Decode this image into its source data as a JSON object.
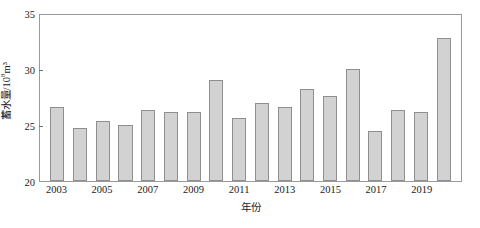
{
  "chart_data": {
    "type": "bar",
    "title": "",
    "subtitle": "",
    "xlabel": "年份",
    "ylabel": "蓄水量/10⁸m³",
    "ylabel_main": "蓄水量/10",
    "ylabel_exp": "8",
    "ylabel_unit": "m³",
    "ylim": [
      20,
      35
    ],
    "yticks": [
      20,
      25,
      30,
      35
    ],
    "ytick_labels": [
      "20",
      "25",
      "30",
      "35"
    ],
    "grid": false,
    "legend": null,
    "categories": [
      "2003",
      "2004",
      "2005",
      "2006",
      "2007",
      "2008",
      "2009",
      "2010",
      "2011",
      "2012",
      "2013",
      "2014",
      "2015",
      "2016",
      "2017",
      "2018",
      "2019",
      "2020"
    ],
    "xtick_labels": [
      "2003",
      "2005",
      "2007",
      "2009",
      "2011",
      "2013",
      "2015",
      "2017",
      "2019"
    ],
    "values": [
      26.6,
      24.7,
      25.4,
      25.0,
      26.3,
      26.2,
      26.2,
      29.0,
      25.6,
      27.0,
      26.6,
      28.2,
      27.6,
      30.0,
      24.5,
      26.3,
      26.2,
      32.8
    ],
    "series": [
      {
        "name": "蓄水量",
        "values": [
          26.6,
          24.7,
          25.4,
          25.0,
          26.3,
          26.2,
          26.2,
          29.0,
          25.6,
          27.0,
          26.6,
          28.2,
          27.6,
          30.0,
          24.5,
          26.3,
          26.2,
          32.8
        ]
      }
    ],
    "colors": {
      "bar_fill": "#d2d2d2",
      "bar_border": "#8f8f8f",
      "axis": "#9a9a9a",
      "text": "#1a1a1a",
      "background": "#ffffff"
    }
  }
}
